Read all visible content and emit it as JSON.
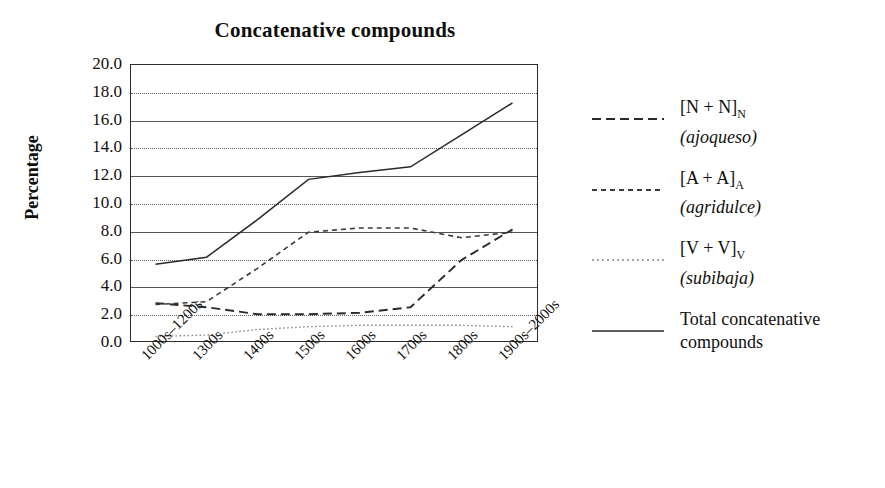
{
  "chart_data": {
    "type": "line",
    "title": "Concatenative compounds",
    "xlabel": "",
    "ylabel": "Percentage",
    "ylim": [
      0,
      20
    ],
    "ytick_step": 2,
    "grid": true,
    "legend_position": "right",
    "categories": [
      "1000s–1200s",
      "1300s",
      "1400s",
      "1500s",
      "1600s",
      "1700s",
      "1800s",
      "1900s–2000s"
    ],
    "ytick_labels": [
      "20.0",
      "18.0",
      "16.0",
      "14.0",
      "12.0",
      "10.0",
      "8.0",
      "6.0",
      "4.0",
      "2.0",
      "0.0"
    ],
    "series": [
      {
        "name": "[N + N]N (ajoqueso)",
        "style": "dashed",
        "values": [
          2.8,
          2.5,
          2.0,
          2.0,
          2.1,
          2.5,
          5.9,
          8.1
        ]
      },
      {
        "name": "[A + A]A (agridulce)",
        "style": "short-dashed",
        "values": [
          2.7,
          2.9,
          5.3,
          7.9,
          8.2,
          8.2,
          7.5,
          7.9
        ]
      },
      {
        "name": "[V + V]V (subibaja)",
        "style": "dotted",
        "values": [
          0.4,
          0.5,
          0.9,
          1.1,
          1.2,
          1.2,
          1.2,
          1.1
        ]
      },
      {
        "name": "Total concatenative compounds",
        "style": "solid",
        "values": [
          5.6,
          6.1,
          8.8,
          11.7,
          12.2,
          12.6,
          14.9,
          17.2
        ]
      }
    ]
  },
  "legend": {
    "entries": [
      {
        "id": "n-plus-n",
        "style": "dashed",
        "label_main": "[N + N]",
        "label_sub": "N",
        "label_second": "(ajoqueso)"
      },
      {
        "id": "a-plus-a",
        "style": "short-dashed",
        "label_main": "[A + A]",
        "label_sub": "A",
        "label_second": "(agridulce)"
      },
      {
        "id": "v-plus-v",
        "style": "dotted",
        "label_main": "[V + V]",
        "label_sub": "V",
        "label_second": "(subibaja)"
      },
      {
        "id": "total",
        "style": "solid",
        "label_main": "Total concatenative",
        "label_sub": "",
        "label_second": "compounds"
      }
    ]
  },
  "colors": {
    "ink": "#100f0d",
    "axis": "#2b2b2b",
    "grid": "#5d5d5d",
    "background": "#ffffff"
  }
}
